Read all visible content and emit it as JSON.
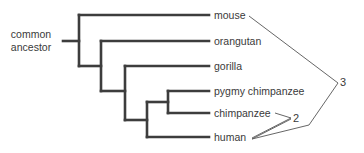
{
  "diagram": {
    "type": "phylogenetic-tree",
    "root_label_line1": "common",
    "root_label_line2": "ancestor",
    "taxa": [
      {
        "label": "mouse"
      },
      {
        "label": "orangutan"
      },
      {
        "label": "gorilla"
      },
      {
        "label": "pygmy chimpanzee"
      },
      {
        "label": "chimpanzee"
      },
      {
        "label": "human"
      }
    ],
    "annotations": [
      {
        "label": "2",
        "connects": [
          "chimpanzee",
          "human"
        ]
      },
      {
        "label": "3",
        "connects": [
          "mouse",
          "human"
        ]
      }
    ],
    "colors": {
      "branch": "#3d3d3d",
      "annotation_line": "#555555",
      "text": "#3a3a3a"
    }
  }
}
